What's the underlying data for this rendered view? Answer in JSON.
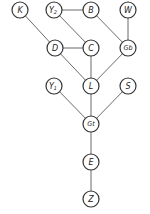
{
  "diagram": {
    "type": "directed-acyclic-graph",
    "nodes": [
      {
        "id": "K",
        "label": "K",
        "x": 20,
        "y": 10
      },
      {
        "id": "Y2",
        "label": "Y",
        "sub": "2",
        "x": 54,
        "y": 10
      },
      {
        "id": "B",
        "label": "B",
        "x": 91,
        "y": 10
      },
      {
        "id": "W",
        "label": "W",
        "x": 128,
        "y": 10
      },
      {
        "id": "D",
        "label": "D",
        "x": 55,
        "y": 48
      },
      {
        "id": "C",
        "label": "C",
        "x": 91,
        "y": 48
      },
      {
        "id": "Gb",
        "label": "Gb",
        "x": 128,
        "y": 48
      },
      {
        "id": "Y1",
        "label": "Y",
        "sub": "1",
        "x": 54,
        "y": 86
      },
      {
        "id": "L",
        "label": "L",
        "x": 91,
        "y": 86
      },
      {
        "id": "S",
        "label": "S",
        "x": 128,
        "y": 86
      },
      {
        "id": "Gt",
        "label": "Gt",
        "x": 91,
        "y": 124
      },
      {
        "id": "E",
        "label": "E",
        "x": 91,
        "y": 162
      },
      {
        "id": "Z",
        "label": "Z",
        "x": 91,
        "y": 199
      }
    ],
    "edges": [
      [
        "Y2",
        "B"
      ],
      [
        "K",
        "D"
      ],
      [
        "Y2",
        "C"
      ],
      [
        "B",
        "Gb"
      ],
      [
        "W",
        "Gb"
      ],
      [
        "D",
        "C"
      ],
      [
        "D",
        "L"
      ],
      [
        "C",
        "L"
      ],
      [
        "Gb",
        "L"
      ],
      [
        "Y1",
        "Gt"
      ],
      [
        "L",
        "Gt"
      ],
      [
        "S",
        "Gt"
      ],
      [
        "Gt",
        "E"
      ],
      [
        "E",
        "Z"
      ]
    ]
  }
}
